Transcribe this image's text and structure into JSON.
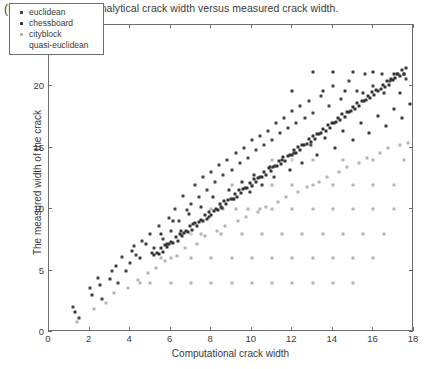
{
  "panel_label": "(b)",
  "chart_data": {
    "type": "scatter",
    "title": "Analytical crack width versus measured crack width.",
    "xlabel": "Computational crack width",
    "ylabel": "The measured width of the crack",
    "xlim": [
      0,
      18
    ],
    "ylim": [
      0,
      25
    ],
    "xticks": [
      0,
      2,
      4,
      6,
      8,
      10,
      12,
      14,
      16,
      18
    ],
    "yticks": [
      0,
      5,
      10,
      15,
      20,
      25
    ],
    "xticklabels": [
      "0",
      "2",
      "4",
      "6",
      "8",
      "10",
      "12",
      "14",
      "16",
      "18"
    ],
    "yticklabels": [
      "0",
      "5",
      "10",
      "15",
      "20",
      "25"
    ],
    "grid": false,
    "legend_position": "upper left",
    "marker": "square",
    "marker_size": 3,
    "series": [
      {
        "name": "euclidean",
        "color": "#454545",
        "points": [
          [
            1.2,
            2.0
          ],
          [
            1.5,
            1.1
          ],
          [
            2.0,
            3.6
          ],
          [
            2.4,
            4.4
          ],
          [
            2.6,
            2.7
          ],
          [
            3.1,
            5.0
          ],
          [
            3.4,
            4.0
          ],
          [
            3.6,
            6.1
          ],
          [
            4.0,
            5.6
          ],
          [
            4.2,
            7.0
          ],
          [
            4.3,
            6.3
          ],
          [
            4.6,
            7.4
          ],
          [
            5.0,
            8.0
          ],
          [
            5.2,
            6.8
          ],
          [
            5.4,
            8.6
          ],
          [
            5.6,
            7.6
          ],
          [
            5.9,
            9.3
          ],
          [
            6.0,
            8.2
          ],
          [
            6.2,
            10.0
          ],
          [
            6.4,
            9.0
          ],
          [
            6.6,
            11.1
          ],
          [
            6.8,
            9.9
          ],
          [
            7.0,
            10.4
          ],
          [
            7.2,
            12.0
          ],
          [
            7.4,
            11.0
          ],
          [
            7.6,
            12.6
          ],
          [
            7.8,
            11.6
          ],
          [
            8.0,
            13.0
          ],
          [
            8.2,
            12.2
          ],
          [
            8.4,
            13.6
          ],
          [
            8.6,
            12.8
          ],
          [
            8.8,
            14.0
          ],
          [
            9.0,
            13.2
          ],
          [
            9.2,
            14.6
          ],
          [
            9.4,
            13.8
          ],
          [
            9.6,
            15.0
          ],
          [
            9.8,
            14.2
          ],
          [
            10.0,
            15.6
          ],
          [
            10.2,
            14.8
          ],
          [
            10.4,
            16.0
          ],
          [
            10.6,
            15.2
          ],
          [
            10.8,
            16.4
          ],
          [
            11.0,
            15.6
          ],
          [
            11.2,
            17.0
          ],
          [
            11.4,
            16.2
          ],
          [
            11.6,
            17.4
          ],
          [
            11.8,
            16.6
          ],
          [
            12.0,
            18.0
          ],
          [
            12.2,
            17.0
          ],
          [
            12.4,
            18.4
          ],
          [
            12.6,
            17.4
          ],
          [
            12.8,
            18.8
          ],
          [
            13.0,
            17.8
          ],
          [
            13.4,
            19.2
          ],
          [
            13.8,
            18.4
          ],
          [
            14.0,
            20.0
          ],
          [
            14.4,
            19.0
          ],
          [
            14.8,
            20.4
          ],
          [
            15.2,
            19.6
          ],
          [
            15.6,
            21.0
          ],
          [
            16.0,
            20.0
          ],
          [
            16.4,
            21.0
          ],
          [
            16.8,
            20.4
          ],
          [
            17.2,
            21.0
          ],
          [
            17.6,
            20.6
          ]
        ]
      },
      {
        "name": "chessboard",
        "color": "#3a3a3a",
        "points": [
          [
            1.3,
            1.6
          ],
          [
            2.1,
            3.0
          ],
          [
            2.5,
            3.8
          ],
          [
            3.0,
            4.3
          ],
          [
            3.3,
            5.4
          ],
          [
            3.8,
            5.0
          ],
          [
            4.1,
            6.6
          ],
          [
            4.5,
            6.0
          ],
          [
            4.8,
            7.2
          ],
          [
            5.1,
            6.4
          ],
          [
            5.5,
            8.0
          ],
          [
            5.8,
            7.2
          ],
          [
            6.1,
            9.0
          ],
          [
            6.5,
            8.2
          ],
          [
            6.9,
            9.6
          ],
          [
            7.1,
            8.8
          ],
          [
            7.5,
            10.2
          ],
          [
            7.9,
            9.4
          ],
          [
            8.1,
            11.0
          ],
          [
            8.5,
            10.2
          ],
          [
            8.9,
            11.6
          ],
          [
            9.1,
            10.8
          ],
          [
            9.5,
            12.2
          ],
          [
            9.9,
            11.4
          ],
          [
            10.1,
            12.8
          ],
          [
            10.5,
            12.0
          ],
          [
            10.9,
            13.4
          ],
          [
            11.1,
            12.6
          ],
          [
            11.5,
            14.0
          ],
          [
            11.9,
            13.2
          ],
          [
            12.1,
            14.6
          ],
          [
            12.5,
            13.8
          ],
          [
            12.9,
            15.2
          ],
          [
            13.2,
            14.4
          ],
          [
            13.6,
            15.8
          ],
          [
            14.1,
            15.0
          ],
          [
            14.5,
            16.4
          ],
          [
            15.0,
            15.6
          ],
          [
            15.4,
            17.0
          ],
          [
            15.8,
            16.2
          ],
          [
            16.2,
            17.6
          ],
          [
            16.6,
            16.8
          ],
          [
            17.0,
            18.2
          ],
          [
            17.4,
            17.4
          ],
          [
            17.8,
            18.6
          ],
          [
            13.0,
            21.2
          ],
          [
            14.0,
            21.2
          ],
          [
            15.0,
            21.2
          ],
          [
            16.0,
            21.2
          ],
          [
            17.0,
            21.0
          ],
          [
            17.5,
            21.0
          ],
          [
            12.0,
            19.6
          ],
          [
            13.5,
            19.6
          ],
          [
            14.6,
            19.6
          ],
          [
            15.5,
            19.5
          ],
          [
            16.5,
            19.5
          ],
          [
            17.3,
            19.5
          ]
        ]
      },
      {
        "name": "cityblock",
        "color": "#b4b4b4",
        "points": [
          [
            1.4,
            0.8
          ],
          [
            2.2,
            1.9
          ],
          [
            2.8,
            2.4
          ],
          [
            3.2,
            3.2
          ],
          [
            3.9,
            3.6
          ],
          [
            4.4,
            4.2
          ],
          [
            4.9,
            4.8
          ],
          [
            5.3,
            5.2
          ],
          [
            5.7,
            5.8
          ],
          [
            6.3,
            6.2
          ],
          [
            6.7,
            6.8
          ],
          [
            7.3,
            7.2
          ],
          [
            7.7,
            7.8
          ],
          [
            8.3,
            8.2
          ],
          [
            8.7,
            8.6
          ],
          [
            9.3,
            9.0
          ],
          [
            9.7,
            9.4
          ],
          [
            10.3,
            9.8
          ],
          [
            10.7,
            10.2
          ],
          [
            11.3,
            10.6
          ],
          [
            11.7,
            11.0
          ],
          [
            12.3,
            11.4
          ],
          [
            12.7,
            11.8
          ],
          [
            13.3,
            12.2
          ],
          [
            13.7,
            12.6
          ],
          [
            14.3,
            13.0
          ],
          [
            14.7,
            13.4
          ],
          [
            15.3,
            13.8
          ],
          [
            15.7,
            14.2
          ],
          [
            16.3,
            14.6
          ],
          [
            16.7,
            15.0
          ],
          [
            17.3,
            15.2
          ],
          [
            17.7,
            15.4
          ],
          [
            8.0,
            10.0
          ],
          [
            8.6,
            10.0
          ],
          [
            9.2,
            10.0
          ],
          [
            9.8,
            10.0
          ],
          [
            10.4,
            10.0
          ],
          [
            11.0,
            10.0
          ],
          [
            12.0,
            10.0
          ],
          [
            13.0,
            10.0
          ],
          [
            14.0,
            10.0
          ],
          [
            15.0,
            10.0
          ],
          [
            16.0,
            10.0
          ],
          [
            17.0,
            10.0
          ],
          [
            9.0,
            12.0
          ],
          [
            10.0,
            12.0
          ],
          [
            11.0,
            12.0
          ],
          [
            12.0,
            12.0
          ],
          [
            13.0,
            12.0
          ],
          [
            14.0,
            12.0
          ],
          [
            15.0,
            12.0
          ],
          [
            16.0,
            12.0
          ],
          [
            17.0,
            12.0
          ],
          [
            11.0,
            14.0
          ],
          [
            12.0,
            14.0
          ],
          [
            13.0,
            14.0
          ],
          [
            14.5,
            14.0
          ],
          [
            16.0,
            14.0
          ],
          [
            17.5,
            14.0
          ],
          [
            6.5,
            8.0
          ],
          [
            7.0,
            8.0
          ],
          [
            7.5,
            8.0
          ],
          [
            8.5,
            8.0
          ],
          [
            9.5,
            8.0
          ],
          [
            10.5,
            8.0
          ],
          [
            11.5,
            8.0
          ],
          [
            12.5,
            8.0
          ],
          [
            13.5,
            8.0
          ],
          [
            14.5,
            8.0
          ],
          [
            15.5,
            8.0
          ],
          [
            16.5,
            8.0
          ],
          [
            5.5,
            6.0
          ],
          [
            6.0,
            6.0
          ],
          [
            7.0,
            6.0
          ],
          [
            8.0,
            6.0
          ],
          [
            9.0,
            6.0
          ],
          [
            10.0,
            6.0
          ],
          [
            11.0,
            6.0
          ],
          [
            12.0,
            6.0
          ],
          [
            13.0,
            6.0
          ],
          [
            14.0,
            6.0
          ],
          [
            15.0,
            6.0
          ],
          [
            16.0,
            6.0
          ],
          [
            4.5,
            4.0
          ],
          [
            5.0,
            4.0
          ],
          [
            6.0,
            4.0
          ],
          [
            7.0,
            4.0
          ],
          [
            8.0,
            4.0
          ],
          [
            9.0,
            4.0
          ],
          [
            10.0,
            4.0
          ],
          [
            11.0,
            4.0
          ],
          [
            12.0,
            4.0
          ],
          [
            13.0,
            4.0
          ],
          [
            14.0,
            4.0
          ],
          [
            15.0,
            4.0
          ]
        ]
      },
      {
        "name": "quasi-euclidean",
        "color": "#ffffff",
        "points": [
          [
            2.0,
            2.0
          ],
          [
            3.0,
            3.2
          ],
          [
            4.0,
            4.4
          ],
          [
            5.0,
            5.6
          ],
          [
            6.0,
            6.8
          ],
          [
            7.0,
            8.0
          ],
          [
            8.0,
            9.2
          ],
          [
            9.0,
            10.4
          ],
          [
            10.0,
            11.6
          ],
          [
            11.0,
            12.8
          ],
          [
            12.0,
            14.0
          ],
          [
            13.0,
            15.2
          ],
          [
            14.0,
            16.4
          ],
          [
            15.0,
            17.6
          ],
          [
            16.0,
            18.8
          ],
          [
            17.0,
            20.0
          ]
        ]
      }
    ],
    "trend_band": {
      "description": "dense dark diagonal cluster of points following y = 1.22x",
      "color": "#333333",
      "slope": 1.22,
      "intercept": -0.1,
      "x_start": 5.2,
      "x_end": 17.6,
      "count": 120
    }
  },
  "legend": {
    "items": [
      {
        "label": "euclidean",
        "color": "#454545"
      },
      {
        "label": "chessboard",
        "color": "#3a3a3a"
      },
      {
        "label": "cityblock",
        "color": "#b4b4b4"
      },
      {
        "label": "quasi-euclidean",
        "color": "#ffffff"
      }
    ]
  }
}
